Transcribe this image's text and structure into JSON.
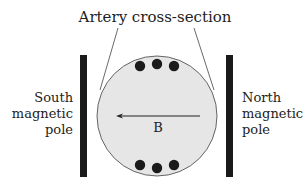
{
  "title": "Artery cross-section",
  "left_pole": {
    "lines": [
      "South",
      "magnetic",
      "pole"
    ]
  },
  "right_pole": {
    "lines": [
      "North",
      "magnetic",
      "pole"
    ]
  },
  "field_label": "B",
  "colors": {
    "pole": "#1a1a1a",
    "artery_fill": "#e6e6e6",
    "artery_stroke": "#555555",
    "ion": "#1a1a1a",
    "text": "#222222"
  }
}
